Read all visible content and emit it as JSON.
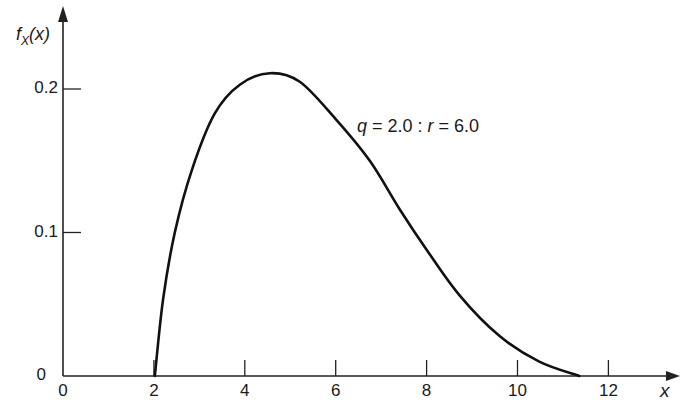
{
  "chart_data": {
    "type": "line",
    "title": "",
    "xlabel": "x",
    "ylabel": "f_X(x)",
    "xlim": [
      0,
      13
    ],
    "ylim": [
      0,
      0.23
    ],
    "x_ticks": [
      0,
      2,
      4,
      6,
      8,
      10,
      12
    ],
    "x_tick_labels": [
      "0",
      "2",
      "4",
      "6",
      "8",
      "10",
      "12"
    ],
    "y_ticks": [
      0,
      0.1,
      0.2
    ],
    "y_tick_labels": [
      "0",
      "0.1",
      "0.2"
    ],
    "grid": false,
    "annotation": "q = 2.0 : r = 6.0",
    "series": [
      {
        "name": "q = 2.0 : r = 6.0",
        "x": [
          2.02,
          2.2,
          2.46,
          2.84,
          3.34,
          3.89,
          4.55,
          5.21,
          6.0,
          6.75,
          7.41,
          8.0,
          8.73,
          9.6,
          10.48,
          11.36
        ],
        "y": [
          0.0,
          0.053,
          0.1,
          0.144,
          0.183,
          0.203,
          0.211,
          0.205,
          0.179,
          0.15,
          0.116,
          0.088,
          0.056,
          0.028,
          0.01,
          0.0
        ]
      }
    ]
  },
  "axis": {
    "y_label_f": "f",
    "y_label_sub": "X",
    "y_label_arg": "(x)",
    "x_label": "x",
    "y_zero_label": "0"
  },
  "annotation": {
    "q": "q",
    "q_val": " = 2.0 : ",
    "r": "r",
    "r_val": " = 6.0"
  },
  "colors": {
    "line": "#111111",
    "axis": "#222222",
    "background": "#ffffff"
  }
}
